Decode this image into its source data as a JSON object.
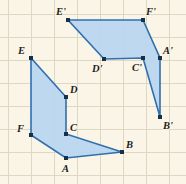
{
  "figure": {
    "width": 186,
    "height": 184,
    "colors": {
      "background": "#faf5e6",
      "grid": "#ded7c4",
      "shape_fill": "#b9d6ef",
      "shape_stroke": "#2f6fae",
      "vertex_dot": "#17304a",
      "label_text": "#1d1d1d"
    },
    "grid": {
      "spacing": 23,
      "x_lines": [
        8,
        31,
        54,
        77,
        100,
        123,
        146,
        169
      ],
      "y_lines": [
        14,
        37,
        60,
        83,
        106,
        129,
        152,
        175
      ]
    },
    "shapes": [
      {
        "name": "hexagon-preimage",
        "label": "ABCDEF",
        "points": "31,58 66,97 66,134 122,152 66,158 31,135",
        "vertices": [
          {
            "id": "E",
            "x": 31,
            "y": 58,
            "label": "E",
            "label_x": 18,
            "label_y": 54
          },
          {
            "id": "D",
            "x": 66,
            "y": 97,
            "label": "D",
            "label_x": 70,
            "label_y": 93
          },
          {
            "id": "C",
            "x": 66,
            "y": 134,
            "label": "C",
            "label_x": 70,
            "label_y": 131
          },
          {
            "id": "B",
            "x": 122,
            "y": 152,
            "label": "B",
            "label_x": 126,
            "label_y": 148
          },
          {
            "id": "A",
            "x": 66,
            "y": 158,
            "label": "A",
            "label_x": 62,
            "label_y": 172
          },
          {
            "id": "F",
            "x": 31,
            "y": 135,
            "label": "F",
            "label_x": 17,
            "label_y": 132
          }
        ]
      },
      {
        "name": "hexagon-image",
        "label": "A'B'C'D'E'F'",
        "points": "68,20 143,20 160,58 160,117 143,58 104,59",
        "vertices": [
          {
            "id": "E-prime",
            "x": 68,
            "y": 20,
            "label": "E'",
            "label_x": 56,
            "label_y": 15
          },
          {
            "id": "F-prime",
            "x": 143,
            "y": 20,
            "label": "F'",
            "label_x": 146,
            "label_y": 15
          },
          {
            "id": "A-prime",
            "x": 160,
            "y": 58,
            "label": "A'",
            "label_x": 163,
            "label_y": 54
          },
          {
            "id": "B-prime",
            "x": 160,
            "y": 117,
            "label": "B'",
            "label_x": 163,
            "label_y": 129
          },
          {
            "id": "C-prime",
            "x": 143,
            "y": 58,
            "label": "C'",
            "label_x": 132,
            "label_y": 71
          },
          {
            "id": "D-prime",
            "x": 104,
            "y": 59,
            "label": "D'",
            "label_x": 92,
            "label_y": 72
          }
        ]
      }
    ]
  }
}
